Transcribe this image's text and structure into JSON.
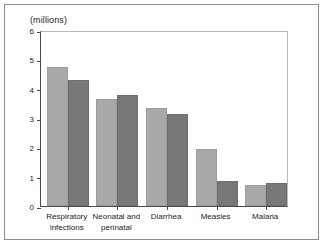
{
  "chart_data": {
    "type": "bar",
    "title": "",
    "subtitle": "",
    "xlabel": "",
    "ylabel": "(millions)",
    "ylim": [
      0,
      6
    ],
    "yticks": [
      0,
      1,
      2,
      3,
      4,
      5,
      6
    ],
    "ytick_labels": [
      "0",
      "1",
      "2",
      "3",
      "4",
      "5",
      "6"
    ],
    "grid": false,
    "legend_position": "top-right",
    "categories": [
      "Respiratory\ninfections",
      "Neonatal and\nperinatal",
      "Diarrhea",
      "Measles",
      "Malaria"
    ],
    "series": [
      {
        "name": "1985",
        "color": "#a9a9a9",
        "values": [
          4.75,
          3.65,
          3.35,
          1.95,
          0.7
        ]
      },
      {
        "name": "1990",
        "color": "#787878",
        "values": [
          4.28,
          3.8,
          3.15,
          0.85,
          0.78
        ]
      }
    ]
  },
  "legend": {
    "entries": [
      {
        "label": "1985",
        "swatch_name": "legend-swatch-1985"
      },
      {
        "label": "1990",
        "swatch_name": "legend-swatch-1990"
      }
    ]
  },
  "axis": {
    "y_unit_caption": "(millions)"
  }
}
